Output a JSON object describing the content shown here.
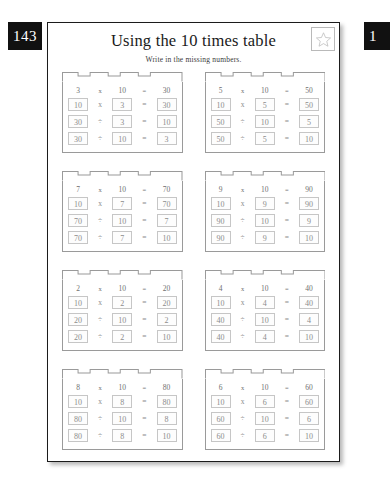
{
  "badges": {
    "left": "143",
    "right": "1"
  },
  "header": {
    "title": "Using the 10 times table",
    "subtitle": "Write in the missing numbers.",
    "star_icon": "star-icon"
  },
  "colors": {
    "badge_background": "#111111",
    "badge_text": "#ffffff",
    "sheet_border": "#1b1b1b",
    "block_border": "#9a9a9a",
    "answer_box_border": "#c6c6c6",
    "answer_text": "#8c8c8c"
  },
  "exercises": [
    {
      "id": 1,
      "rows": [
        {
          "boxed": false,
          "a": "3",
          "op1": "x",
          "b": "10",
          "eq": "=",
          "c": "30"
        },
        {
          "boxed": true,
          "a": "10",
          "op1": "x",
          "b": "3",
          "eq": "=",
          "c": "30"
        },
        {
          "boxed": true,
          "a": "30",
          "op1": "÷",
          "b": "3",
          "eq": "=",
          "c": "10"
        },
        {
          "boxed": true,
          "a": "30",
          "op1": "÷",
          "b": "10",
          "eq": "=",
          "c": "3"
        }
      ]
    },
    {
      "id": 2,
      "rows": [
        {
          "boxed": false,
          "a": "5",
          "op1": "x",
          "b": "10",
          "eq": "=",
          "c": "50"
        },
        {
          "boxed": true,
          "a": "10",
          "op1": "x",
          "b": "5",
          "eq": "=",
          "c": "50"
        },
        {
          "boxed": true,
          "a": "50",
          "op1": "÷",
          "b": "10",
          "eq": "=",
          "c": "5"
        },
        {
          "boxed": true,
          "a": "50",
          "op1": "÷",
          "b": "5",
          "eq": "=",
          "c": "10"
        }
      ]
    },
    {
      "id": 3,
      "rows": [
        {
          "boxed": false,
          "a": "7",
          "op1": "x",
          "b": "10",
          "eq": "=",
          "c": "70"
        },
        {
          "boxed": true,
          "a": "10",
          "op1": "x",
          "b": "7",
          "eq": "=",
          "c": "70"
        },
        {
          "boxed": true,
          "a": "70",
          "op1": "÷",
          "b": "10",
          "eq": "=",
          "c": "7"
        },
        {
          "boxed": true,
          "a": "70",
          "op1": "÷",
          "b": "7",
          "eq": "=",
          "c": "10"
        }
      ]
    },
    {
      "id": 4,
      "rows": [
        {
          "boxed": false,
          "a": "9",
          "op1": "x",
          "b": "10",
          "eq": "=",
          "c": "90"
        },
        {
          "boxed": true,
          "a": "10",
          "op1": "x",
          "b": "9",
          "eq": "=",
          "c": "90"
        },
        {
          "boxed": true,
          "a": "90",
          "op1": "÷",
          "b": "10",
          "eq": "=",
          "c": "9"
        },
        {
          "boxed": true,
          "a": "90",
          "op1": "÷",
          "b": "9",
          "eq": "=",
          "c": "10"
        }
      ]
    },
    {
      "id": 5,
      "rows": [
        {
          "boxed": false,
          "a": "2",
          "op1": "x",
          "b": "10",
          "eq": "=",
          "c": "20"
        },
        {
          "boxed": true,
          "a": "10",
          "op1": "x",
          "b": "2",
          "eq": "=",
          "c": "20"
        },
        {
          "boxed": true,
          "a": "20",
          "op1": "÷",
          "b": "10",
          "eq": "=",
          "c": "2"
        },
        {
          "boxed": true,
          "a": "20",
          "op1": "÷",
          "b": "2",
          "eq": "=",
          "c": "10"
        }
      ]
    },
    {
      "id": 6,
      "rows": [
        {
          "boxed": false,
          "a": "4",
          "op1": "x",
          "b": "10",
          "eq": "=",
          "c": "40"
        },
        {
          "boxed": true,
          "a": "10",
          "op1": "x",
          "b": "4",
          "eq": "=",
          "c": "40"
        },
        {
          "boxed": true,
          "a": "40",
          "op1": "÷",
          "b": "10",
          "eq": "=",
          "c": "4"
        },
        {
          "boxed": true,
          "a": "40",
          "op1": "÷",
          "b": "4",
          "eq": "=",
          "c": "10"
        }
      ]
    },
    {
      "id": 7,
      "rows": [
        {
          "boxed": false,
          "a": "8",
          "op1": "x",
          "b": "10",
          "eq": "=",
          "c": "80"
        },
        {
          "boxed": true,
          "a": "10",
          "op1": "x",
          "b": "8",
          "eq": "=",
          "c": "80"
        },
        {
          "boxed": true,
          "a": "80",
          "op1": "÷",
          "b": "10",
          "eq": "=",
          "c": "8"
        },
        {
          "boxed": true,
          "a": "80",
          "op1": "÷",
          "b": "8",
          "eq": "=",
          "c": "10"
        }
      ]
    },
    {
      "id": 8,
      "rows": [
        {
          "boxed": false,
          "a": "6",
          "op1": "x",
          "b": "10",
          "eq": "=",
          "c": "60"
        },
        {
          "boxed": true,
          "a": "10",
          "op1": "x",
          "b": "6",
          "eq": "=",
          "c": "60"
        },
        {
          "boxed": true,
          "a": "60",
          "op1": "÷",
          "b": "10",
          "eq": "=",
          "c": "6"
        },
        {
          "boxed": true,
          "a": "60",
          "op1": "÷",
          "b": "6",
          "eq": "=",
          "c": "10"
        }
      ]
    }
  ]
}
